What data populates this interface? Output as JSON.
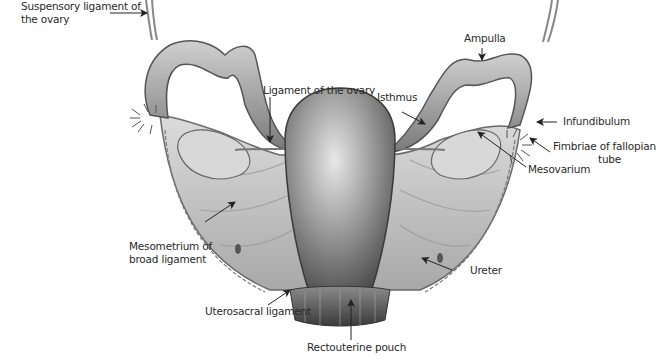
{
  "diagram": {
    "background": "#ffffff",
    "text_color": "#2a2a2a",
    "labels": {
      "suspensory_ligament": "Suspensory ligament of the ovary",
      "suspensory_line1": "Suspensory ligament of",
      "suspensory_line2": "the ovary",
      "ligament_of_ovary": "Ligament of the ovary",
      "isthmus": "Isthmus",
      "ampulla": "Ampulla",
      "infundibulum": "Infundibulum",
      "fimbriae_line1": "Fimbriae of fallopian",
      "fimbriae_line2": "tube",
      "mesovarium": "Mesovarium",
      "mesometrium_line1": "Mesometrium of",
      "mesometrium_line2": "broad ligament",
      "ureter": "Ureter",
      "uterosacral": "Uterosacral ligament",
      "rectouterine": "Rectouterine pouch"
    }
  }
}
